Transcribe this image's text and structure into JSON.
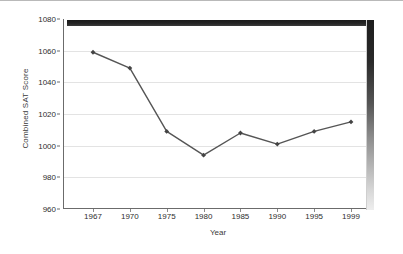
{
  "chart_data": {
    "type": "line",
    "title": "",
    "xlabel": "Year",
    "ylabel": "Combined SAT Score",
    "categories": [
      "1967",
      "1970",
      "1975",
      "1980",
      "1985",
      "1990",
      "1995",
      "1999"
    ],
    "values": [
      1059,
      1049,
      1009,
      994,
      1008,
      1001,
      1009,
      1015
    ],
    "yticks": [
      960,
      980,
      1000,
      1020,
      1040,
      1060,
      1080
    ],
    "ylim": [
      960,
      1080
    ],
    "grid": true,
    "legend": false,
    "legend_position": "none",
    "series": [
      {
        "name": "Combined SAT Score",
        "values": [
          1059,
          1049,
          1009,
          994,
          1008,
          1001,
          1009,
          1015
        ],
        "color": "#555555",
        "marker": "diamond"
      }
    ],
    "colors": {
      "line": "#555555",
      "marker": "#444444",
      "grid": "#e3e3e3",
      "axis": "#6b6b6b",
      "text": "#2e2e2e",
      "plot_background": "#ffffff",
      "top_bar": "#1a1a1a",
      "right_shadow": "#2a2a2a"
    }
  }
}
